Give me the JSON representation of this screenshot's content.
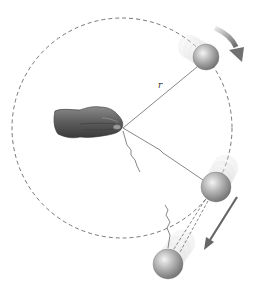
{
  "diagram": {
    "type": "circular-motion-string-break",
    "labels": {
      "radius": "r"
    },
    "circle": {
      "cx": 122,
      "cy": 128,
      "r": 110,
      "style": "dashed",
      "color": "#555555"
    },
    "balls": [
      {
        "id": "top-ball",
        "cx": 206,
        "cy": 57,
        "r": 13
      },
      {
        "id": "middle-ball",
        "cx": 216,
        "cy": 187,
        "r": 15
      },
      {
        "id": "escaping-ball",
        "cx": 168,
        "cy": 264,
        "r": 15
      }
    ],
    "arrows": [
      {
        "id": "rotation-arrow",
        "description": "curved arrow indicating clockwise motion"
      },
      {
        "id": "tangent-velocity-arrow",
        "description": "straight arrow along tangent after string breaks"
      }
    ],
    "colors": {
      "ball": "#9a9a9a",
      "string": "#444444",
      "arrow": "#6b6b6b",
      "hand": "#5a5a5a"
    }
  }
}
